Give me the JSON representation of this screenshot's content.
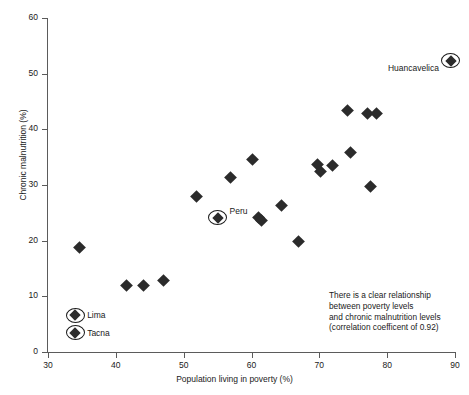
{
  "chart_data": {
    "type": "scatter",
    "title": "",
    "xlabel": "Population living in poverty (%)",
    "ylabel": "Chronic malnutrition (%)",
    "xlim": [
      30,
      90
    ],
    "ylim": [
      0,
      60
    ],
    "xticks": [
      30,
      40,
      50,
      60,
      70,
      80,
      90
    ],
    "yticks": [
      0,
      10,
      20,
      30,
      40,
      50,
      60
    ],
    "grid": false,
    "legend": "none",
    "marker_style": "filled-diamond",
    "highlight_style": "circled-diamond",
    "points": [
      {
        "name": "Tacna",
        "x": 34.0,
        "y": 3.5,
        "highlighted": true,
        "label": "Tacna",
        "label_side": "right"
      },
      {
        "name": "Lima",
        "x": 34.0,
        "y": 6.6,
        "highlighted": true,
        "label": "Lima",
        "label_side": "right"
      },
      {
        "name": "",
        "x": 34.6,
        "y": 18.8,
        "highlighted": false,
        "label": "",
        "label_side": ""
      },
      {
        "name": "",
        "x": 41.6,
        "y": 12.0,
        "highlighted": false,
        "label": "",
        "label_side": ""
      },
      {
        "name": "",
        "x": 44.1,
        "y": 12.0,
        "highlighted": false,
        "label": "",
        "label_side": ""
      },
      {
        "name": "",
        "x": 47.0,
        "y": 12.9,
        "highlighted": false,
        "label": "",
        "label_side": ""
      },
      {
        "name": "",
        "x": 51.9,
        "y": 28.0,
        "highlighted": false,
        "label": "",
        "label_side": ""
      },
      {
        "name": "Peru",
        "x": 55.0,
        "y": 24.1,
        "highlighted": true,
        "label": "Peru",
        "label_side": "right"
      },
      {
        "name": "",
        "x": 56.9,
        "y": 31.3,
        "highlighted": false,
        "label": "",
        "label_side": ""
      },
      {
        "name": "",
        "x": 60.2,
        "y": 34.5,
        "highlighted": false,
        "label": "",
        "label_side": ""
      },
      {
        "name": "",
        "x": 61.1,
        "y": 24.2,
        "highlighted": false,
        "label": "",
        "label_side": ""
      },
      {
        "name": "",
        "x": 61.5,
        "y": 23.7,
        "highlighted": false,
        "label": "",
        "label_side": ""
      },
      {
        "name": "",
        "x": 64.4,
        "y": 26.3,
        "highlighted": false,
        "label": "",
        "label_side": ""
      },
      {
        "name": "",
        "x": 66.9,
        "y": 19.9,
        "highlighted": false,
        "label": "",
        "label_side": ""
      },
      {
        "name": "",
        "x": 69.8,
        "y": 33.6,
        "highlighted": false,
        "label": "",
        "label_side": ""
      },
      {
        "name": "",
        "x": 70.2,
        "y": 32.4,
        "highlighted": false,
        "label": "",
        "label_side": ""
      },
      {
        "name": "",
        "x": 71.9,
        "y": 33.5,
        "highlighted": false,
        "label": "",
        "label_side": ""
      },
      {
        "name": "",
        "x": 74.1,
        "y": 43.3,
        "highlighted": false,
        "label": "",
        "label_side": ""
      },
      {
        "name": "",
        "x": 74.6,
        "y": 35.9,
        "highlighted": false,
        "label": "",
        "label_side": ""
      },
      {
        "name": "",
        "x": 77.1,
        "y": 42.9,
        "highlighted": false,
        "label": "",
        "label_side": ""
      },
      {
        "name": "",
        "x": 78.4,
        "y": 42.9,
        "highlighted": false,
        "label": "",
        "label_side": ""
      },
      {
        "name": "",
        "x": 77.6,
        "y": 29.8,
        "highlighted": false,
        "label": "",
        "label_side": ""
      },
      {
        "name": "Huancavelica",
        "x": 89.4,
        "y": 52.3,
        "highlighted": true,
        "label": "Huancavelica",
        "label_side": "left"
      }
    ],
    "annotation": {
      "lines": [
        "There is a clear relationship",
        "between poverty levels",
        "and chronic malnutrition levels",
        "(correlation coefficent of 0.92)"
      ],
      "correlation": 0.92
    },
    "colors": {
      "marker": "#2b2b2b",
      "axis": "#5b5b5b",
      "text": "#1a1a1a",
      "background": "#ffffff"
    }
  }
}
